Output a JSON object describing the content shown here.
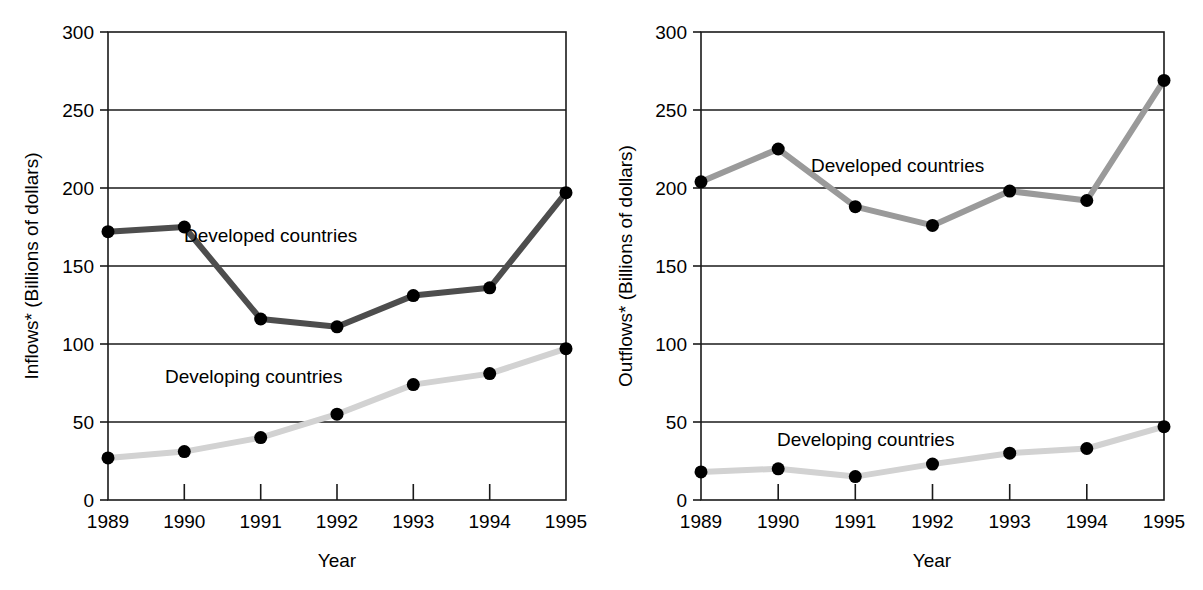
{
  "chart_data": [
    {
      "type": "line",
      "panel": "left",
      "title": "",
      "xlabel": "Year",
      "ylabel": "Inflows* (Billions of dollars)",
      "categories": [
        "1989",
        "1990",
        "1991",
        "1992",
        "1993",
        "1994",
        "1995"
      ],
      "x": [
        1989,
        1990,
        1991,
        1992,
        1993,
        1994,
        1995
      ],
      "ylim": [
        0,
        300
      ],
      "yticks": [
        0,
        50,
        100,
        150,
        200,
        250,
        300
      ],
      "ytick_labels": [
        "0",
        "50",
        "100",
        "150",
        "200",
        "250",
        "300"
      ],
      "grid": true,
      "legend": "inline-annotations",
      "series": [
        {
          "name": "Developed countries",
          "color": "#4d4d4d",
          "marker_color": "#000000",
          "values": [
            172,
            175,
            116,
            111,
            131,
            136,
            197
          ]
        },
        {
          "name": "Developing countries",
          "color": "#d2d2d2",
          "marker_color": "#000000",
          "values": [
            27,
            31,
            40,
            55,
            74,
            81,
            97
          ]
        }
      ],
      "annotations": [
        {
          "text": "Developed countries",
          "x": 1991.0,
          "y": 163
        },
        {
          "text": "Developing countries",
          "x": 1990.5,
          "y": 68
        }
      ]
    },
    {
      "type": "line",
      "panel": "right",
      "title": "",
      "xlabel": "Year",
      "ylabel": "Outflows* (Billions of dollars)",
      "categories": [
        "1989",
        "1990",
        "1991",
        "1992",
        "1993",
        "1994",
        "1995"
      ],
      "x": [
        1989,
        1990,
        1991,
        1992,
        1993,
        1994,
        1995
      ],
      "ylim": [
        0,
        300
      ],
      "yticks": [
        0,
        50,
        100,
        150,
        200,
        250,
        300
      ],
      "ytick_labels": [
        "0",
        "50",
        "100",
        "150",
        "200",
        "250",
        "300"
      ],
      "grid": true,
      "legend": "inline-annotations",
      "series": [
        {
          "name": "Developed countries",
          "color": "#9a9a9a",
          "marker_color": "#000000",
          "values": [
            204,
            225,
            188,
            176,
            198,
            192,
            269
          ]
        },
        {
          "name": "Developing countries",
          "color": "#d2d2d2",
          "marker_color": "#000000",
          "values": [
            18,
            20,
            15,
            23,
            30,
            33,
            47
          ]
        }
      ],
      "annotations": [
        {
          "text": "Developed countries",
          "x": 1991.1,
          "y": 214
        },
        {
          "text": "Developing countries",
          "x": 1990.5,
          "y": 35
        }
      ]
    }
  ],
  "panels": {
    "left": {
      "ylabel": "Inflows* (Billions of dollars)",
      "xlabel": "Year",
      "ytick_labels": [
        "300",
        "250",
        "200",
        "150",
        "100",
        "50",
        "0"
      ],
      "xtick_labels": [
        "1989",
        "1990",
        "1991",
        "1992",
        "1993",
        "1994",
        "1995"
      ],
      "developed_label": "Developed countries",
      "developing_label": "Developing countries"
    },
    "right": {
      "ylabel": "Outflows* (Billions of dollars)",
      "xlabel": "Year",
      "ytick_labels": [
        "300",
        "250",
        "200",
        "150",
        "100",
        "50",
        "0"
      ],
      "xtick_labels": [
        "1989",
        "1990",
        "1991",
        "1992",
        "1993",
        "1994",
        "1995"
      ],
      "developed_label": "Developed countries",
      "developing_label": "Developing countries"
    }
  },
  "colors": {
    "developed_left": "#4d4d4d",
    "developed_right": "#9a9a9a",
    "developing": "#d2d2d2",
    "marker": "#000000",
    "axis": "#1a1a1a",
    "background": "#ffffff"
  }
}
